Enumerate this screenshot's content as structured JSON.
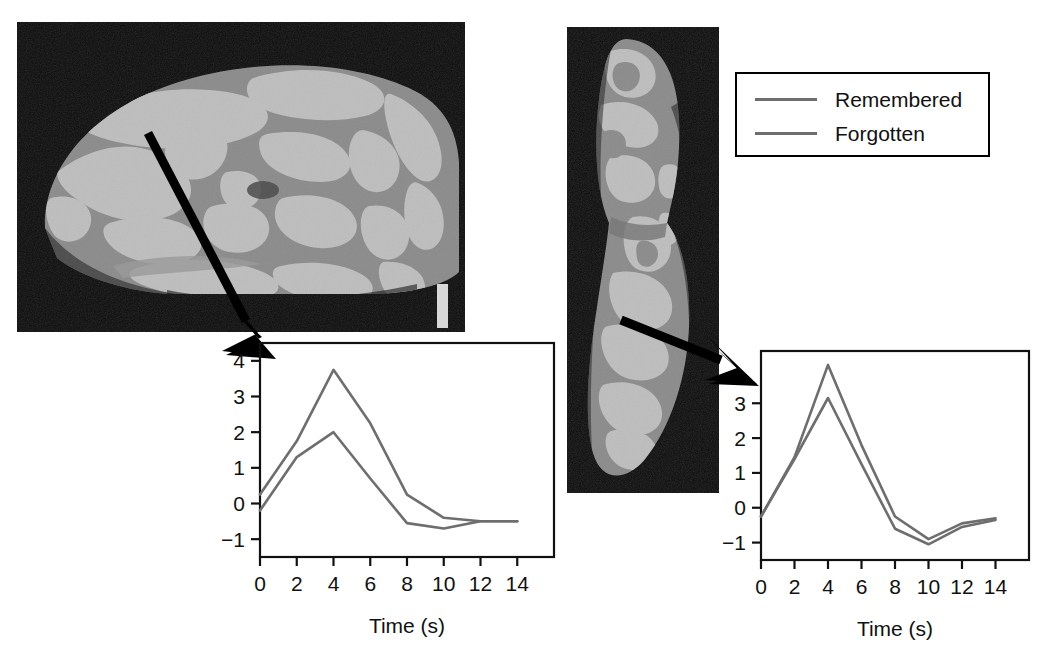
{
  "figure": {
    "title": "",
    "background": "#ffffff"
  },
  "legend": {
    "name": "plot-legend",
    "border_color": "#000000",
    "entries": [
      {
        "label": "Remembered",
        "color": "#6e6e6e",
        "swatch": "line-swatch"
      },
      {
        "label": "Forgotten",
        "color": "#6e6e6e",
        "swatch": "line-swatch"
      }
    ]
  },
  "brain_panels": [
    {
      "name": "lateral-cortical-surface",
      "view": "lateral inflated cortical surface",
      "background": "#0d0d0d",
      "gyri_color": "#b9b9b9",
      "sulci_color": "#8a8a8a",
      "scale_bar": true
    },
    {
      "name": "ventral-temporal-surface",
      "view": "ventral inflated cortical surface",
      "background": "#0d0d0d",
      "gyri_color": "#b9b9b9",
      "sulci_color": "#8a8a8a",
      "scale_bar": false
    }
  ],
  "arrows": [
    {
      "name": "arrow-to-left-plot",
      "from": "lateral-cortical-surface",
      "to": "left-timecourse-plot",
      "color": "#000000"
    },
    {
      "name": "arrow-to-right-plot",
      "from": "ventral-temporal-surface",
      "to": "right-timecourse-plot",
      "color": "#000000"
    }
  ],
  "chart_data": [
    {
      "name": "left-timecourse-plot",
      "type": "line",
      "title": "",
      "xlabel": "Time (s)",
      "ylabel": "",
      "x": [
        0,
        2,
        4,
        6,
        8,
        10,
        12,
        14
      ],
      "xticks": [
        "0",
        "2",
        "4",
        "6",
        "8",
        "10",
        "12",
        "14"
      ],
      "yticks": [
        "4",
        "3",
        "2",
        "1",
        "0",
        "-1"
      ],
      "xlim": [
        0,
        16
      ],
      "ylim": [
        -1.5,
        4.5
      ],
      "grid": false,
      "legend_position": "external-top-right",
      "series": [
        {
          "name": "Remembered",
          "color": "#6e6e6e",
          "values": [
            0.25,
            1.75,
            3.75,
            2.25,
            0.25,
            -0.4,
            -0.5,
            -0.5
          ]
        },
        {
          "name": "Forgotten",
          "color": "#6e6e6e",
          "values": [
            -0.2,
            1.3,
            2.0,
            0.7,
            -0.55,
            -0.7,
            -0.5,
            -0.5
          ]
        }
      ]
    },
    {
      "name": "right-timecourse-plot",
      "type": "line",
      "title": "",
      "xlabel": "Time (s)",
      "ylabel": "",
      "x": [
        0,
        2,
        4,
        6,
        8,
        10,
        12,
        14
      ],
      "xticks": [
        "0",
        "2",
        "4",
        "6",
        "8",
        "10",
        "12",
        "14"
      ],
      "yticks": [
        "3",
        "2",
        "1",
        "0",
        "-1"
      ],
      "xlim": [
        0,
        16
      ],
      "ylim": [
        -1.5,
        4.5
      ],
      "grid": false,
      "legend_position": "external-top-right",
      "series": [
        {
          "name": "Remembered",
          "color": "#6e6e6e",
          "values": [
            -0.25,
            1.45,
            4.1,
            1.8,
            -0.25,
            -0.9,
            -0.45,
            -0.3
          ]
        },
        {
          "name": "Forgotten",
          "color": "#6e6e6e",
          "values": [
            -0.25,
            1.4,
            3.15,
            1.25,
            -0.6,
            -1.05,
            -0.55,
            -0.35
          ]
        }
      ]
    }
  ]
}
